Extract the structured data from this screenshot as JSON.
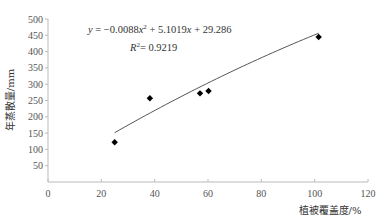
{
  "chart_data": {
    "type": "scatter",
    "title": "",
    "xlabel": "植被覆盖度/%",
    "ylabel": "年蒸散量/mm",
    "xlim": [
      0,
      120
    ],
    "ylim": [
      0,
      500
    ],
    "xticks": [
      0,
      20,
      40,
      60,
      80,
      100,
      120
    ],
    "yticks": [
      50,
      100,
      150,
      200,
      250,
      300,
      350,
      400,
      450,
      500
    ],
    "grid": false,
    "series": [
      {
        "name": "observations",
        "marker": "diamond",
        "color": "#000000",
        "points": [
          {
            "x": 25.0,
            "y": 122
          },
          {
            "x": 38.2,
            "y": 257
          },
          {
            "x": 57.0,
            "y": 272
          },
          {
            "x": 60.2,
            "y": 279
          },
          {
            "x": 101.5,
            "y": 445
          }
        ]
      }
    ],
    "trendline": {
      "type": "polynomial",
      "order": 2,
      "coefficients": {
        "a": -0.0088,
        "b": 5.1019,
        "c": 29.286
      },
      "x_range": [
        25,
        101.5
      ],
      "color": "#555555"
    },
    "annotations": {
      "equation": "y = −0.0088x² + 5.1019x + 29.286",
      "r_squared": "R² = 0.9219"
    }
  }
}
